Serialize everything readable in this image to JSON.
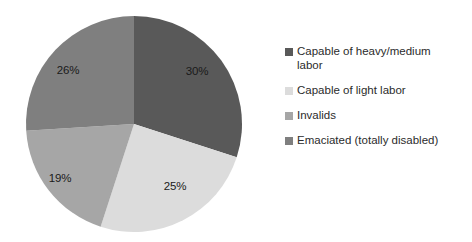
{
  "chart_data": {
    "type": "pie",
    "title": "",
    "subtitle": "",
    "xlabel": "",
    "ylabel": "",
    "grid": false,
    "legend_position": "right",
    "start_angle_deg": 0,
    "direction": "clockwise",
    "categories": [
      "Capable of heavy/medium labor",
      "Capable of light labor",
      "Invalids",
      "Emaciated (totally disabled)"
    ],
    "values": [
      30,
      25,
      19,
      26
    ],
    "value_labels": [
      "30%",
      "25%",
      "19%",
      "26%"
    ],
    "colors": [
      "#595959",
      "#dcdcdc",
      "#a6a6a6",
      "#7f7f7f"
    ],
    "units": "percent",
    "total": 100
  },
  "pie": {
    "center_x": 134,
    "center_y": 124,
    "radius": 108,
    "background_color": "#ffffff",
    "slices": [
      {
        "label": "30%",
        "value": 30,
        "color": "#595959",
        "label_x": 197,
        "label_y": 71
      },
      {
        "label": "25%",
        "value": 25,
        "color": "#dcdcdc",
        "label_x": 175,
        "label_y": 186
      },
      {
        "label": "19%",
        "value": 19,
        "color": "#a6a6a6",
        "label_x": 60,
        "label_y": 178
      },
      {
        "label": "26%",
        "value": 26,
        "color": "#7f7f7f",
        "label_x": 68,
        "label_y": 70
      }
    ]
  },
  "legend": {
    "items": [
      {
        "label": "Capable of heavy/medium labor",
        "color": "#595959"
      },
      {
        "label": "Capable of light labor",
        "color": "#dcdcdc"
      },
      {
        "label": "Invalids",
        "color": "#a6a6a6"
      },
      {
        "label": "Emaciated (totally disabled)",
        "color": "#7f7f7f"
      }
    ]
  }
}
